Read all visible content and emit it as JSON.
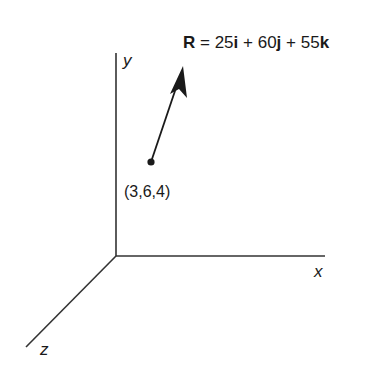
{
  "diagram": {
    "axes": {
      "x_label": "x",
      "y_label": "y",
      "z_label": "z"
    },
    "point": {
      "label": "(3,6,4)",
      "coords": [
        3,
        6,
        4
      ]
    },
    "vector": {
      "name": "R",
      "equation": {
        "lhs": "R",
        "equals": " = ",
        "c1": "25",
        "u1": "i",
        "plus1": " + ",
        "c2": "60",
        "u2": "j",
        "plus2": " + ",
        "c3": "55",
        "u3": "k"
      },
      "components": {
        "i": 25,
        "j": 60,
        "k": 55
      }
    },
    "colors": {
      "ink": "#1a1a1a",
      "background": "#ffffff"
    }
  }
}
